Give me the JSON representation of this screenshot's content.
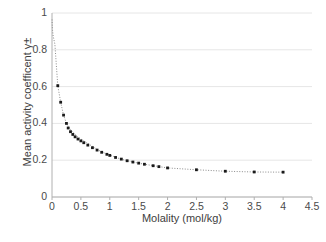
{
  "chart_data": {
    "type": "scatter",
    "title": "",
    "xlabel": "Molality (mol/kg)",
    "ylabel": "Mean activity coefficent γ±",
    "xlim": [
      0,
      4.5
    ],
    "ylim": [
      0,
      1
    ],
    "xticks": [
      "0",
      "0.5",
      "1",
      "1.5",
      "2",
      "2.5",
      "3",
      "3.5",
      "4",
      "4.5"
    ],
    "xtick_values": [
      0,
      0.5,
      1,
      1.5,
      2,
      2.5,
      3,
      3.5,
      4,
      4.5
    ],
    "yticks": [
      "0",
      "0.2",
      "0.4",
      "0.6",
      "0.8",
      "1"
    ],
    "ytick_values": [
      0,
      0.2,
      0.4,
      0.6,
      0.8,
      1
    ],
    "grid": "horizontal",
    "legend": "none",
    "marker": "square",
    "marker_color": "#1a1a1a",
    "line_style": "dotted",
    "line_color": "#8c8c8c",
    "series": [
      {
        "name": "Mean activity coefficient",
        "x": [
          0.001,
          0.002,
          0.005,
          0.01,
          0.02,
          0.05,
          0.1,
          0.15,
          0.2,
          0.25,
          0.3,
          0.35,
          0.4,
          0.45,
          0.5,
          0.6,
          0.7,
          0.8,
          0.9,
          1.0,
          1.2,
          1.4,
          1.6,
          1.8,
          2.0,
          2.5,
          3.0,
          3.5,
          4.0
        ],
        "y": [
          0.965,
          0.952,
          0.928,
          0.904,
          0.875,
          0.83,
          0.605,
          0.515,
          0.445,
          0.4,
          0.375,
          0.355,
          0.34,
          0.325,
          0.315,
          0.295,
          0.275,
          0.255,
          0.24,
          0.228,
          0.205,
          0.19,
          0.178,
          0.168,
          0.158,
          0.148,
          0.14,
          0.136,
          0.135
        ]
      }
    ],
    "marker_points": {
      "x": [
        0.1,
        0.15,
        0.2,
        0.25,
        0.28,
        0.32,
        0.36,
        0.4,
        0.45,
        0.5,
        0.55,
        0.62,
        0.7,
        0.78,
        0.86,
        0.95,
        1.0,
        1.1,
        1.2,
        1.3,
        1.4,
        1.5,
        1.6,
        1.75,
        1.85,
        2.0,
        2.5,
        3.0,
        3.5,
        4.0
      ],
      "y": [
        0.605,
        0.515,
        0.445,
        0.4,
        0.375,
        0.355,
        0.34,
        0.327,
        0.315,
        0.305,
        0.295,
        0.282,
        0.268,
        0.255,
        0.243,
        0.232,
        0.226,
        0.215,
        0.206,
        0.197,
        0.19,
        0.184,
        0.178,
        0.17,
        0.165,
        0.158,
        0.148,
        0.14,
        0.136,
        0.135
      ]
    }
  },
  "axes": {
    "x_title": "Molality (mol/kg)",
    "y_title": "Mean activity coefficent γ±"
  },
  "labels": {
    "y": [
      "1",
      "0.8",
      "0.6",
      "0.4",
      "0.2",
      "0"
    ],
    "x": [
      "0",
      "0.5",
      "1",
      "1.5",
      "2",
      "2.5",
      "3",
      "3.5",
      "4",
      "4.5"
    ]
  },
  "colors": {
    "axis": "#b3b3b3",
    "grid": "#e6e6e6",
    "marker": "#1a1a1a",
    "line": "#8c8c8c",
    "text": "#3d3d3d",
    "background": "#ffffff"
  }
}
